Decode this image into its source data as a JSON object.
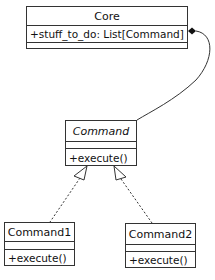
{
  "diagram": {
    "type": "uml-class-diagram",
    "classes": [
      {
        "id": "core",
        "name": "Core",
        "abstract": false,
        "attributes": [
          "+stuff_to_do: List[Command]"
        ],
        "methods": []
      },
      {
        "id": "command",
        "name": "Command",
        "abstract": true,
        "attributes": [],
        "methods": [
          "+execute()"
        ]
      },
      {
        "id": "command1",
        "name": "Command1",
        "abstract": false,
        "attributes": [],
        "methods": [
          "+execute()"
        ]
      },
      {
        "id": "command2",
        "name": "Command2",
        "abstract": false,
        "attributes": [],
        "methods": [
          "+execute()"
        ]
      }
    ],
    "relationships": [
      {
        "type": "composition",
        "from": "Core",
        "to": "Command"
      },
      {
        "type": "realization",
        "from": "Command1",
        "to": "Command"
      },
      {
        "type": "realization",
        "from": "Command2",
        "to": "Command"
      }
    ],
    "colors": {
      "line": "#333333",
      "background": "#ffffff"
    }
  }
}
